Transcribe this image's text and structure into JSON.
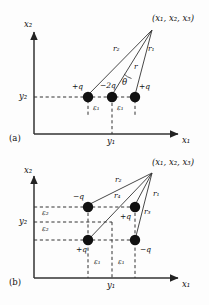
{
  "figure": {
    "type": "physics-diagram",
    "background_color": "#fdfdfd",
    "ink_color": "#111111"
  },
  "panel_a": {
    "tag": "(a)",
    "axis_x_label": "x₁",
    "axis_y_label": "x₂",
    "x_tick_label": "y₁",
    "y_tick_label": "y₂",
    "field_point_label": "(x₁, x₂, x₃)",
    "charges": [
      {
        "label": "+q",
        "sign": "positive",
        "position": "left"
      },
      {
        "label": "−2q",
        "sign": "negative",
        "position": "center"
      },
      {
        "label": "+q",
        "sign": "positive",
        "position": "right"
      }
    ],
    "rays": [
      {
        "label": "r₂",
        "from": "left-charge"
      },
      {
        "label": "r",
        "from": "center-charge"
      },
      {
        "label": "r₁",
        "from": "right-charge"
      }
    ],
    "angle_label": "θ",
    "spacing_labels": [
      "ε₁",
      "ε₁"
    ]
  },
  "panel_b": {
    "tag": "(b)",
    "axis_x_label": "x₁",
    "axis_y_label": "x₂",
    "x_tick_label": "y₁",
    "y_tick_label": "y₂",
    "field_point_label": "(x₁, x₂, x₃)",
    "charges": [
      {
        "label": "−q",
        "sign": "negative",
        "position": "upper-left"
      },
      {
        "label": "+q",
        "sign": "positive",
        "position": "upper-right"
      },
      {
        "label": "+q",
        "sign": "positive",
        "position": "lower-left"
      },
      {
        "label": "−q",
        "sign": "negative",
        "position": "lower-right"
      }
    ],
    "rays": [
      {
        "label": "r₂",
        "from": "upper-left-charge"
      },
      {
        "label": "r₄",
        "from": "lower-left-charge"
      },
      {
        "label": "r₁",
        "from": "upper-right-charge"
      },
      {
        "label": "r₃",
        "from": "lower-right-charge"
      }
    ],
    "horizontal_spacing_labels": [
      "ε₁",
      "ε₁"
    ],
    "vertical_spacing_labels": [
      "ε₂",
      "ε₂"
    ]
  }
}
